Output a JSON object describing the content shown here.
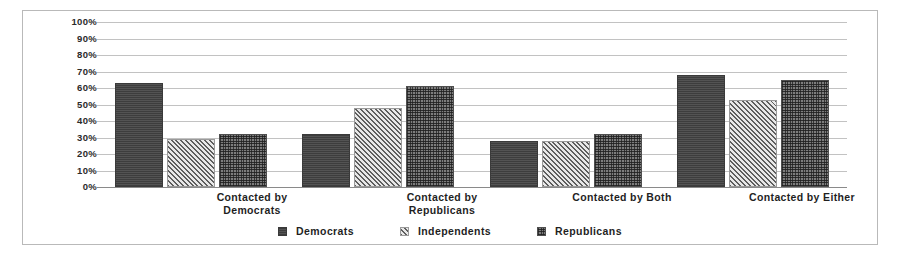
{
  "chart_data": {
    "type": "bar",
    "title": "",
    "xlabel": "",
    "ylabel": "",
    "ylim": [
      0,
      100
    ],
    "ytick_labels": [
      "100%",
      "90%",
      "80%",
      "70%",
      "60%",
      "50%",
      "40%",
      "30%",
      "20%",
      "10%",
      "0%"
    ],
    "ytick_values": [
      100,
      90,
      80,
      70,
      60,
      50,
      40,
      30,
      20,
      10,
      0
    ],
    "grid": true,
    "legend_position": "bottom",
    "categories": [
      "Contacted by Democrats",
      "Contacted by Republicans",
      "Contacted by Both",
      "Contacted by Either"
    ],
    "category_lines": [
      [
        "Contacted by",
        "Democrats"
      ],
      [
        "Contacted by",
        "Republicans"
      ],
      [
        "Contacted by Both"
      ],
      [
        "Contacted by Either"
      ]
    ],
    "series": [
      {
        "name": "Democrats",
        "pattern": "solid-dark",
        "color": "#4a4a4a",
        "values": [
          63,
          32,
          28,
          68
        ]
      },
      {
        "name": "Independents",
        "pattern": "diagonal-hatch",
        "color": "#d8d8d8",
        "values": [
          29,
          48,
          28,
          53
        ]
      },
      {
        "name": "Republicans",
        "pattern": "dotted-checker",
        "color": "#7d7d7d",
        "values": [
          32,
          61,
          32,
          65
        ]
      }
    ]
  },
  "legend": {
    "items": [
      {
        "label": "Democrats",
        "swatch": "swatch-solid-dark"
      },
      {
        "label": "Independents",
        "swatch": "swatch-diagonal-hatch"
      },
      {
        "label": "Republicans",
        "swatch": "swatch-dotted-checker"
      }
    ]
  }
}
